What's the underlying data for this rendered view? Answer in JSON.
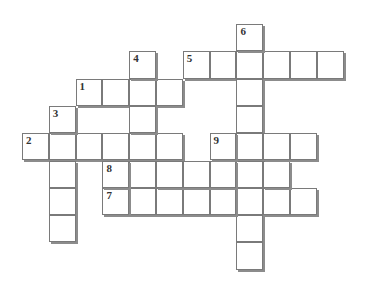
{
  "puzzle": {
    "type": "crossword",
    "origin": {
      "x": 22,
      "y": 24
    },
    "cell_w": 26.8,
    "cell_h": 27.3,
    "colors": {
      "border": "#7a7a7a",
      "shadow": "#8c8c8c",
      "fill": "#ffffff",
      "number": "#333333"
    },
    "entries": [
      {
        "number": "1",
        "direction": "across",
        "row": 2,
        "col": 2,
        "length": 4
      },
      {
        "number": "2",
        "direction": "across",
        "row": 4,
        "col": 0,
        "length": 6
      },
      {
        "number": "3",
        "direction": "down",
        "row": 3,
        "col": 1,
        "length": 5
      },
      {
        "number": "4",
        "direction": "down",
        "row": 1,
        "col": 4,
        "length": 6
      },
      {
        "number": "5",
        "direction": "across",
        "row": 1,
        "col": 6,
        "length": 6
      },
      {
        "number": "6",
        "direction": "down",
        "row": 0,
        "col": 8,
        "length": 9
      },
      {
        "number": "7",
        "direction": "across",
        "row": 6,
        "col": 3,
        "length": 8
      },
      {
        "number": "8",
        "direction": "across",
        "row": 5,
        "col": 3,
        "length": 7
      },
      {
        "number": "9",
        "direction": "across",
        "row": 4,
        "col": 7,
        "length": 4
      }
    ]
  }
}
